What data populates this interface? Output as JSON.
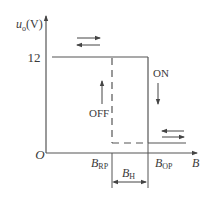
{
  "diagram": {
    "type": "hysteresis-characteristic",
    "y_axis": {
      "symbol": "u",
      "subscript": "o",
      "unit": "(V)"
    },
    "x_axis": {
      "symbol": "B"
    },
    "origin_label": "O",
    "level_label": "12",
    "state_labels": {
      "on": "ON",
      "off": "OFF"
    },
    "thresholds": {
      "release": {
        "symbol": "B",
        "subscript": "RP"
      },
      "operate": {
        "symbol": "B",
        "subscript": "OP"
      },
      "hysteresis": {
        "symbol": "B",
        "subscript": "H"
      }
    },
    "colors": {
      "line": "#555555",
      "text": "#3a3a3a",
      "background": "#ffffff"
    }
  }
}
